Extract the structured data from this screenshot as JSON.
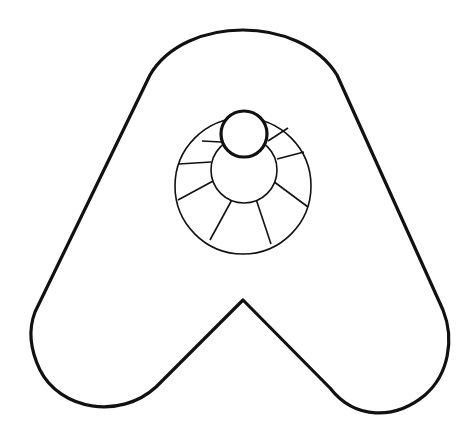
{
  "image": {
    "description": "Line drawing of a rounded letter A shape with a circular dial/wheel element in the center",
    "background": "#ffffff",
    "stroke": "#111111"
  },
  "shapes": {
    "letter_a_outline": {
      "label": "letter-a"
    },
    "outer_circle": {
      "cx": 243,
      "cy": 186,
      "r": 68
    },
    "inner_circle": {
      "cx": 244,
      "cy": 176,
      "r": 34
    },
    "top_knob": {
      "cx": 244,
      "cy": 134,
      "r": 24
    },
    "spokes_count": 8
  }
}
